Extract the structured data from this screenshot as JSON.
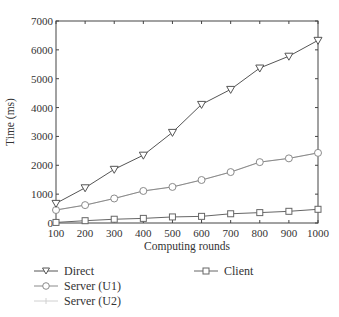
{
  "chart_data": {
    "type": "line",
    "title": "",
    "xlabel": "Computing rounds",
    "ylabel": "Time (ms)",
    "xlim": [
      100,
      1000
    ],
    "ylim": [
      0,
      7000
    ],
    "x": [
      100,
      200,
      300,
      400,
      500,
      600,
      700,
      800,
      900,
      1000
    ],
    "xticks": [
      "100",
      "200",
      "300",
      "400",
      "500",
      "600",
      "700",
      "800",
      "900",
      "1000"
    ],
    "yticks": [
      "0",
      "1000",
      "2000",
      "3000",
      "4000",
      "5000",
      "6000",
      "7000"
    ],
    "grid": false,
    "legend_position": "below",
    "series": [
      {
        "name": "Direct",
        "marker": "triangle-down",
        "color": "#555555",
        "values": [
          680,
          1220,
          1860,
          2350,
          3140,
          4110,
          4630,
          5370,
          5780,
          6330
        ]
      },
      {
        "name": "Server (U1)",
        "marker": "circle",
        "color": "#8a8a8a",
        "values": [
          450,
          620,
          850,
          1110,
          1250,
          1490,
          1765,
          2110,
          2240,
          2430
        ]
      },
      {
        "name": "Server (U2)",
        "marker": "plus",
        "color": "#d0d0d0",
        "values": [
          450,
          620,
          850,
          1110,
          1250,
          1490,
          1765,
          2110,
          2240,
          2430
        ]
      },
      {
        "name": "Client",
        "marker": "square",
        "color": "#666666",
        "values": [
          20,
          80,
          130,
          160,
          210,
          230,
          320,
          360,
          405,
          475
        ]
      }
    ]
  },
  "legend": {
    "items": [
      "Direct",
      "Server (U1)",
      "Server (U2)",
      "Client"
    ]
  }
}
